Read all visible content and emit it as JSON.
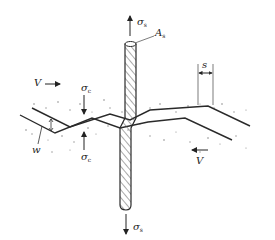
{
  "diagram": {
    "colors": {
      "line": "#2a2a2a",
      "hatch": "#555555",
      "aggregate": "#888888",
      "background": "#ffffff"
    },
    "labels": {
      "sigma_s_top": {
        "symbol": "σ",
        "sub": "s"
      },
      "area": {
        "symbol": "A",
        "sub": "s"
      },
      "V_left": {
        "symbol": "V"
      },
      "V_right": {
        "symbol": "V"
      },
      "sigma_c_top": {
        "symbol": "σ",
        "sub": "c"
      },
      "sigma_c_bottom": {
        "symbol": "σ",
        "sub": "c"
      },
      "w": {
        "symbol": "w"
      },
      "s": {
        "symbol": "s"
      },
      "sigma_s_bottom": {
        "symbol": "σ",
        "sub": "s"
      }
    },
    "elements": [
      "reinforcing-bar",
      "crack-interface-upper",
      "crack-interface-lower",
      "shear-arrow-left",
      "shear-arrow-right",
      "compression-arrow-top",
      "compression-arrow-bottom",
      "tension-arrow-top",
      "tension-arrow-bottom",
      "crack-width-dimension",
      "slip-dimension",
      "aggregate-stipple"
    ]
  }
}
